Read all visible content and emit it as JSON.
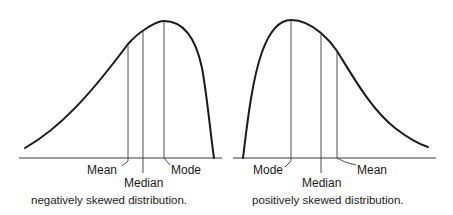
{
  "diagrams": [
    {
      "id": "negative",
      "caption": "negatively skewed distribution.",
      "labels": {
        "mean": "Mean",
        "median": "Median",
        "mode": "Mode"
      }
    },
    {
      "id": "positive",
      "caption": "positively skewed distribution.",
      "labels": {
        "mode": "Mode",
        "median": "Median",
        "mean": "Mean"
      }
    }
  ],
  "colors": {
    "line": "#1a1a1a",
    "background": "#ffffff"
  }
}
